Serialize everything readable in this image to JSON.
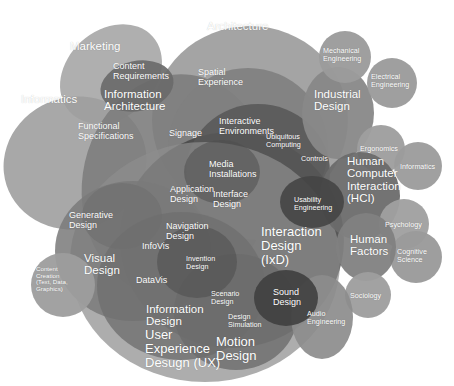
{
  "diagram": {
    "background_color": "#ffffff",
    "label_color": "#ffffff",
    "palette": {
      "lightest": "#b9b9b9",
      "light": "#a2a2a2",
      "mid_light": "#8e8e8e",
      "mid": "#767676",
      "mid_dark": "#606060",
      "dark": "#4c4c4c",
      "darkest": "#3a3a3a"
    }
  },
  "blobs": [
    {
      "name": "marketing",
      "cx": 111,
      "cy": 74,
      "rx": 56,
      "ry": 44,
      "rot": -42,
      "fill": "#a8a8a8",
      "alpha": 0.92
    },
    {
      "name": "informatics-left",
      "cx": 75,
      "cy": 163,
      "rx": 72,
      "ry": 66,
      "rot": -18,
      "fill": "#9e9e9e",
      "alpha": 0.9
    },
    {
      "name": "architecture",
      "cx": 250,
      "cy": 120,
      "rx": 98,
      "ry": 94,
      "rot": 0,
      "fill": "#9a9a9a",
      "alpha": 0.9
    },
    {
      "name": "information-architecture",
      "cx": 176,
      "cy": 186,
      "rx": 94,
      "ry": 112,
      "rot": 8,
      "fill": "#7d7d7d",
      "alpha": 0.9
    },
    {
      "name": "content-requirements",
      "cx": 137,
      "cy": 86,
      "rx": 37,
      "ry": 25,
      "rot": -12,
      "fill": "#6a6a6a",
      "alpha": 0.92
    },
    {
      "name": "spatial-experience",
      "cx": 248,
      "cy": 148,
      "rx": 80,
      "ry": 80,
      "rot": 0,
      "fill": "#808080",
      "alpha": 0.9
    },
    {
      "name": "interaction-design-ixd",
      "cx": 232,
      "cy": 240,
      "rx": 112,
      "ry": 108,
      "rot": 0,
      "fill": "#4a4a4a",
      "alpha": 0.93
    },
    {
      "name": "interactive-environments",
      "cx": 258,
      "cy": 172,
      "rx": 72,
      "ry": 68,
      "rot": 0,
      "fill": "#585858",
      "alpha": 0.88
    },
    {
      "name": "user-experience-design",
      "cx": 205,
      "cy": 262,
      "rx": 135,
      "ry": 120,
      "rot": 0,
      "fill": "#8d8d8d",
      "alpha": 0.72
    },
    {
      "name": "visual-design",
      "cx": 133,
      "cy": 251,
      "rx": 78,
      "ry": 70,
      "rot": 0,
      "fill": "#7a7a7a",
      "alpha": 0.86
    },
    {
      "name": "information-design",
      "cx": 181,
      "cy": 286,
      "rx": 84,
      "ry": 74,
      "rot": 0,
      "fill": "#6f6f6f",
      "alpha": 0.8
    },
    {
      "name": "motion-design",
      "cx": 236,
      "cy": 312,
      "rx": 62,
      "ry": 58,
      "rot": 0,
      "fill": "#6b6b6b",
      "alpha": 0.8
    },
    {
      "name": "content-creation",
      "cx": 63,
      "cy": 285,
      "rx": 32,
      "ry": 32,
      "rot": 0,
      "fill": "#9d9d9d",
      "alpha": 0.95
    },
    {
      "name": "generative-design",
      "cx": 122,
      "cy": 216,
      "rx": 40,
      "ry": 33,
      "rot": 0,
      "fill": "#6e6e6e",
      "alpha": 0.6
    },
    {
      "name": "industrial-design",
      "cx": 338,
      "cy": 113,
      "rx": 36,
      "ry": 46,
      "rot": 0,
      "fill": "#888888",
      "alpha": 0.95
    },
    {
      "name": "mechanical-engineering",
      "cx": 345,
      "cy": 57,
      "rx": 26,
      "ry": 26,
      "rot": 0,
      "fill": "#9b9b9b",
      "alpha": 0.96
    },
    {
      "name": "electrical-engineering",
      "cx": 392,
      "cy": 83,
      "rx": 25,
      "ry": 25,
      "rot": 0,
      "fill": "#9b9b9b",
      "alpha": 0.96
    },
    {
      "name": "ergonomics",
      "cx": 381,
      "cy": 149,
      "rx": 24,
      "ry": 24,
      "rot": 0,
      "fill": "#9e9e9e",
      "alpha": 0.96
    },
    {
      "name": "human-computer-interaction",
      "cx": 360,
      "cy": 196,
      "rx": 40,
      "ry": 44,
      "rot": 0,
      "fill": "#6c6c6c",
      "alpha": 0.95
    },
    {
      "name": "informatics-right",
      "cx": 418,
      "cy": 166,
      "rx": 24,
      "ry": 24,
      "rot": 0,
      "fill": "#9c9c9c",
      "alpha": 0.96
    },
    {
      "name": "psychology",
      "cx": 404,
      "cy": 224,
      "rx": 25,
      "ry": 25,
      "rot": 0,
      "fill": "#a0a0a0",
      "alpha": 0.96
    },
    {
      "name": "cognitive-science",
      "cx": 416,
      "cy": 257,
      "rx": 26,
      "ry": 26,
      "rot": 0,
      "fill": "#9a9a9a",
      "alpha": 0.96
    },
    {
      "name": "human-factors",
      "cx": 366,
      "cy": 247,
      "rx": 30,
      "ry": 34,
      "rot": 0,
      "fill": "#818181",
      "alpha": 0.95
    },
    {
      "name": "sociology",
      "cx": 368,
      "cy": 295,
      "rx": 23,
      "ry": 23,
      "rot": 0,
      "fill": "#9e9e9e",
      "alpha": 0.96
    },
    {
      "name": "audio-engineering",
      "cx": 322,
      "cy": 317,
      "rx": 31,
      "ry": 42,
      "rot": 0,
      "fill": "#8c8c8c",
      "alpha": 0.92
    },
    {
      "name": "usability-engineering",
      "cx": 312,
      "cy": 202,
      "rx": 32,
      "ry": 26,
      "rot": 0,
      "fill": "#454545",
      "alpha": 0.9
    },
    {
      "name": "sound-design",
      "cx": 286,
      "cy": 298,
      "rx": 32,
      "ry": 28,
      "rot": 0,
      "fill": "#3f3f3f",
      "alpha": 0.9
    },
    {
      "name": "media-installations",
      "cx": 222,
      "cy": 172,
      "rx": 38,
      "ry": 32,
      "rot": 0,
      "fill": "#4e4e4e",
      "alpha": 0.55
    },
    {
      "name": "invention-design",
      "cx": 197,
      "cy": 262,
      "rx": 40,
      "ry": 36,
      "rot": 0,
      "fill": "#4a4a4a",
      "alpha": 0.5
    }
  ],
  "labels": [
    {
      "name": "label-marketing",
      "text": "Marketing",
      "x": 70,
      "y": 40,
      "size": "lbl-lg"
    },
    {
      "name": "label-informatics-left",
      "text": "Informatics",
      "x": 21,
      "y": 93,
      "size": "lbl-lg"
    },
    {
      "name": "label-architecture",
      "text": "Architecture",
      "x": 207,
      "y": 20,
      "size": "lbl-lg"
    },
    {
      "name": "label-content-requirements",
      "text": "Content\nRequirements",
      "x": 113,
      "y": 62,
      "size": "lbl-md"
    },
    {
      "name": "label-information-architecture",
      "text": "Information\nArchitecture",
      "x": 104,
      "y": 88,
      "size": "lbl-lg"
    },
    {
      "name": "label-spatial-experience",
      "text": "Spatial\nExperience",
      "x": 198,
      "y": 68,
      "size": "lbl-md"
    },
    {
      "name": "label-functional-specifications",
      "text": "Functional\nSpecifications",
      "x": 78,
      "y": 122,
      "size": "lbl-md"
    },
    {
      "name": "label-signage",
      "text": "Signage",
      "x": 169,
      "y": 129,
      "size": "lbl-md"
    },
    {
      "name": "label-interactive-environments",
      "text": "Interactive\nEnvironments",
      "x": 219,
      "y": 117,
      "size": "lbl-md"
    },
    {
      "name": "label-ubiquitous-computing",
      "text": "Ubiquitous\nComputing",
      "x": 266,
      "y": 133,
      "size": "lbl-sm"
    },
    {
      "name": "label-controls",
      "text": "Controls",
      "x": 301,
      "y": 155,
      "size": "lbl-sm"
    },
    {
      "name": "label-media-installations",
      "text": "Media\nInstallations",
      "x": 209,
      "y": 160,
      "size": "lbl-md"
    },
    {
      "name": "label-application-design",
      "text": "Application\nDesign",
      "x": 170,
      "y": 185,
      "size": "lbl-md"
    },
    {
      "name": "label-interface-design",
      "text": "Interface\nDesign",
      "x": 213,
      "y": 190,
      "size": "lbl-md"
    },
    {
      "name": "label-usability-engineering",
      "text": "Usability\nEngineering",
      "x": 294,
      "y": 196,
      "size": "lbl-sm"
    },
    {
      "name": "label-mechanical-engineering",
      "text": "Mechanical\nEngineering",
      "x": 323,
      "y": 47,
      "size": "lbl-sm"
    },
    {
      "name": "label-electrical-engineering",
      "text": "Electrical\nEngineering",
      "x": 371,
      "y": 73,
      "size": "lbl-sm"
    },
    {
      "name": "label-industrial-design",
      "text": "Industrial\nDesign",
      "x": 314,
      "y": 88,
      "size": "lbl-lg"
    },
    {
      "name": "label-ergonomics",
      "text": "Ergonomics",
      "x": 360,
      "y": 145,
      "size": "lbl-sm"
    },
    {
      "name": "label-informatics-right",
      "text": "Informatics",
      "x": 400,
      "y": 163,
      "size": "lbl-sm"
    },
    {
      "name": "label-human-computer-interaction",
      "text": "Human\nComputer\nInteraction\n(HCI)",
      "x": 347,
      "y": 155,
      "size": "lbl-lg"
    },
    {
      "name": "label-psychology",
      "text": "Psychology",
      "x": 385,
      "y": 221,
      "size": "lbl-sm"
    },
    {
      "name": "label-human-factors",
      "text": "Human\nFactors",
      "x": 350,
      "y": 233,
      "size": "lbl-lg"
    },
    {
      "name": "label-cognitive-science",
      "text": "Cognitive\nScience",
      "x": 397,
      "y": 248,
      "size": "lbl-sm"
    },
    {
      "name": "label-sociology",
      "text": "Sociology",
      "x": 350,
      "y": 292,
      "size": "lbl-sm"
    },
    {
      "name": "label-generative-design",
      "text": "Generative\nDesign",
      "x": 69,
      "y": 211,
      "size": "lbl-md"
    },
    {
      "name": "label-visual-design",
      "text": "Visual\nDesign",
      "x": 84,
      "y": 252,
      "size": "lbl-lg"
    },
    {
      "name": "label-navigation-design",
      "text": "Navigation\nDesign",
      "x": 166,
      "y": 222,
      "size": "lbl-md"
    },
    {
      "name": "label-infovis",
      "text": "InfoVis",
      "x": 142,
      "y": 242,
      "size": "lbl-md"
    },
    {
      "name": "label-datavis",
      "text": "DataVis",
      "x": 136,
      "y": 276,
      "size": "lbl-md"
    },
    {
      "name": "label-invention-design",
      "text": "Invention\nDesign",
      "x": 186,
      "y": 255,
      "size": "lbl-sm"
    },
    {
      "name": "label-interaction-design",
      "text": "Interaction\nDesign\n(IxD)",
      "x": 261,
      "y": 225,
      "size": "lbl-xl"
    },
    {
      "name": "label-content-creation",
      "text": "Content\nCreation\n(Text, Data,\nGraphics)",
      "x": 36,
      "y": 266,
      "size": "lbl-xs"
    },
    {
      "name": "label-scenario-design",
      "text": "Scenario\nDesign",
      "x": 211,
      "y": 290,
      "size": "lbl-sm"
    },
    {
      "name": "label-sound-design",
      "text": "Sound\nDesign",
      "x": 273,
      "y": 288,
      "size": "lbl-md"
    },
    {
      "name": "label-design-simulation",
      "text": "Design\nSimulation",
      "x": 228,
      "y": 313,
      "size": "lbl-sm"
    },
    {
      "name": "label-audio-engineering",
      "text": "Audio\nEngineering",
      "x": 307,
      "y": 310,
      "size": "lbl-sm"
    },
    {
      "name": "label-information-design",
      "text": "Information\nDesign",
      "x": 146,
      "y": 303,
      "size": "lbl-lg"
    },
    {
      "name": "label-user-experience-design",
      "text": "User\nExperience\nDesugn (UX)",
      "x": 145,
      "y": 328,
      "size": "lbl-xl"
    },
    {
      "name": "label-motion-design",
      "text": "Motion\nDesign",
      "x": 216,
      "y": 335,
      "size": "lbl-xl"
    }
  ]
}
